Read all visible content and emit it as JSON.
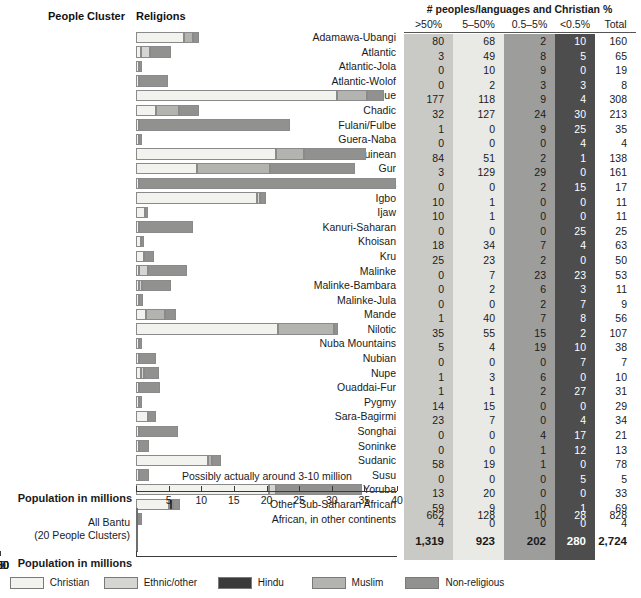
{
  "chart_headers": {
    "people_cluster": "People Cluster",
    "religions": "Religions"
  },
  "axis": {
    "title": "Population in millions",
    "top_ticks": [
      "5",
      "10",
      "15",
      "20",
      "25",
      "30",
      "35",
      "40"
    ],
    "bantu_ticks": [
      "50",
      "100",
      "150",
      "200",
      "250",
      "300"
    ],
    "top_max": 40,
    "bantu_max": 300
  },
  "annotation": "Possibly actually around 3-10 million",
  "bantu": {
    "label_line1": "All Bantu",
    "label_line2": "(20 People Clusters)"
  },
  "legend": [
    {
      "name": "Christian",
      "color": "#f2f2ef"
    },
    {
      "name": "Ethnic/other",
      "color": "#d5d5d2"
    },
    {
      "name": "Hindu",
      "color": "#3a3a3a"
    },
    {
      "name": "Muslim",
      "color": "#b3b3b0"
    },
    {
      "name": "Non-religious",
      "color": "#919190"
    }
  ],
  "table": {
    "title": "# peoples/languages and Christian %",
    "columns": [
      ">50%",
      "5–50%",
      "0.5–5%",
      "<0.5%",
      "Total"
    ],
    "summary_row": [
      "662",
      "128",
      "10",
      "28",
      "828"
    ],
    "grand_total_row": [
      "1,319",
      "923",
      "202",
      "280",
      "2,724"
    ]
  },
  "chart_data": {
    "type": "bar",
    "title": "Religions",
    "xlabel": "Population in millions",
    "ylabel": "People Cluster",
    "stacked": true,
    "xlim": [
      0,
      40
    ],
    "grid": false,
    "legend_position": "bottom",
    "series_names": [
      "Christian",
      "Ethnic/other",
      "Hindu",
      "Muslim",
      "Non-religious"
    ],
    "series_colors": [
      "#f2f2ef",
      "#d5d5d2",
      "#3a3a3a",
      "#b3b3b0",
      "#919190"
    ],
    "categories": [
      "Adamawa-Ubangi",
      "Atlantic",
      "Atlantic-Jola",
      "Atlantic-Wolof",
      "Benue",
      "Chadic",
      "Fulani/Fulbe",
      "Guera-Naba",
      "Guinean",
      "Gur",
      "Hausa",
      "Igbo",
      "Ijaw",
      "Kanuri-Saharan",
      "Khoisan",
      "Kru",
      "Malinke",
      "Malinke-Bambara",
      "Malinke-Jula",
      "Mande",
      "Nilotic",
      "Nuba Mountains",
      "Nubian",
      "Nupe",
      "Ouaddai-Fur",
      "Pygmy",
      "Sara-Bagirmi",
      "Songhai",
      "Soninke",
      "Sudanic",
      "Susu",
      "Yoruba",
      "Other Sub-Saharan African",
      "African, in other continents"
    ],
    "stacks": [
      {
        "category": "Adamawa-Ubangi",
        "christian": 7.3,
        "ethnic": 0.0,
        "hindu": 0.0,
        "muslim": 1.4,
        "nonreligious": 1.0
      },
      {
        "category": "Atlantic",
        "christian": 0.8,
        "ethnic": 1.3,
        "hindu": 0.0,
        "muslim": 0.0,
        "nonreligious": 3.2
      },
      {
        "category": "Atlantic-Jola",
        "christian": 0.15,
        "ethnic": 0.0,
        "hindu": 0.0,
        "muslim": 0.0,
        "nonreligious": 0.25
      },
      {
        "category": "Atlantic-Wolof",
        "christian": 0.1,
        "ethnic": 0.0,
        "hindu": 0.0,
        "muslim": 0.0,
        "nonreligious": 4.5
      },
      {
        "category": "Benue",
        "christian": 30.8,
        "ethnic": 0.0,
        "hindu": 0.0,
        "muslim": 4.6,
        "nonreligious": 2.6
      },
      {
        "category": "Chadic",
        "christian": 3.0,
        "ethnic": 0.0,
        "hindu": 0.0,
        "muslim": 3.6,
        "nonreligious": 3.1
      },
      {
        "category": "Fulani/Fulbe",
        "christian": 0.2,
        "ethnic": 0.0,
        "hindu": 0.0,
        "muslim": 0.0,
        "nonreligious": 23.2
      },
      {
        "category": "Guera-Naba",
        "christian": 0.1,
        "ethnic": 0.0,
        "hindu": 0.0,
        "muslim": 0.0,
        "nonreligious": 0.3
      },
      {
        "category": "Guinean",
        "christian": 21.5,
        "ethnic": 0.0,
        "hindu": 0.0,
        "muslim": 4.2,
        "nonreligious": 9.6
      },
      {
        "category": "Gur",
        "christian": 9.3,
        "ethnic": 0.0,
        "hindu": 0.0,
        "muslim": 11.3,
        "nonreligious": 13.0
      },
      {
        "category": "Hausa",
        "christian": 0.5,
        "ethnic": 0.0,
        "hindu": 0.0,
        "muslim": 0.0,
        "nonreligious": 39.3
      },
      {
        "category": "Igbo",
        "christian": 18.5,
        "ethnic": 0.3,
        "hindu": 0.0,
        "muslim": 0.0,
        "nonreligious": 0.9
      },
      {
        "category": "Ijaw",
        "christian": 1.4,
        "ethnic": 0.0,
        "hindu": 0.0,
        "muslim": 0.0,
        "nonreligious": 0.5
      },
      {
        "category": "Kanuri-Saharan",
        "christian": 0.1,
        "ethnic": 0.0,
        "hindu": 0.0,
        "muslim": 0.0,
        "nonreligious": 8.2
      },
      {
        "category": "Khoisan",
        "christian": 0.7,
        "ethnic": 0.0,
        "hindu": 0.0,
        "muslim": 0.0,
        "nonreligious": 0.35
      },
      {
        "category": "Kru",
        "christian": 1.3,
        "ethnic": 0.0,
        "hindu": 0.0,
        "muslim": 0.0,
        "nonreligious": 1.4
      },
      {
        "category": "Malinke",
        "christian": 0.4,
        "ethnic": 1.4,
        "hindu": 0.0,
        "muslim": 0.0,
        "nonreligious": 6.0
      },
      {
        "category": "Malinke-Bambara",
        "christian": 0.25,
        "ethnic": 0.3,
        "hindu": 0.0,
        "muslim": 0.0,
        "nonreligious": 4.5
      },
      {
        "category": "Malinke-Jula",
        "christian": 0.1,
        "ethnic": 0.0,
        "hindu": 0.0,
        "muslim": 0.0,
        "nonreligious": 0.6
      },
      {
        "category": "Mande",
        "christian": 1.6,
        "ethnic": 0.0,
        "hindu": 0.0,
        "muslim": 2.9,
        "nonreligious": 1.6
      },
      {
        "category": "Nilotic",
        "christian": 21.8,
        "ethnic": 0.0,
        "hindu": 0.0,
        "muslim": 8.6,
        "nonreligious": 0.6
      },
      {
        "category": "Nuba Mountains",
        "christian": 0.2,
        "ethnic": 0.0,
        "hindu": 0.0,
        "muslim": 0.0,
        "nonreligious": 0.5
      },
      {
        "category": "Nubian",
        "christian": 0.1,
        "ethnic": 0.0,
        "hindu": 0.0,
        "muslim": 0.0,
        "nonreligious": 2.6
      },
      {
        "category": "Nupe",
        "christian": 0.7,
        "ethnic": 0.25,
        "hindu": 0.0,
        "muslim": 0.0,
        "nonreligious": 2.3
      },
      {
        "category": "Ouaddai-Fur",
        "christian": 0.1,
        "ethnic": 0.0,
        "hindu": 0.0,
        "muslim": 0.0,
        "nonreligious": 3.2
      },
      {
        "category": "Pygmy",
        "christian": 0.2,
        "ethnic": 0.0,
        "hindu": 0.0,
        "muslim": 0.0,
        "nonreligious": 0.15
      },
      {
        "category": "Sara-Bagirmi",
        "christian": 1.9,
        "ethnic": 0.0,
        "hindu": 0.0,
        "muslim": 0.0,
        "nonreligious": 1.1
      },
      {
        "category": "Songhai",
        "christian": 0.15,
        "ethnic": 0.0,
        "hindu": 0.0,
        "muslim": 0.0,
        "nonreligious": 6.0
      },
      {
        "category": "Soninke",
        "christian": 0.1,
        "ethnic": 0.0,
        "hindu": 0.0,
        "muslim": 0.0,
        "nonreligious": 1.6
      },
      {
        "category": "Sudanic",
        "christian": 11.0,
        "ethnic": 0.0,
        "hindu": 0.0,
        "muslim": 0.6,
        "nonreligious": 1.4
      },
      {
        "category": "Susu",
        "christian": 0.1,
        "ethnic": 0.0,
        "hindu": 0.0,
        "muslim": 0.0,
        "nonreligious": 1.5
      },
      {
        "category": "Yoruba",
        "christian": 20.4,
        "ethnic": 1.1,
        "hindu": 0.0,
        "muslim": 0.0,
        "nonreligious": 13.2
      },
      {
        "category": "Other Sub-Saharan African",
        "christian": 5.1,
        "ethnic": 0.0,
        "hindu": 0.5,
        "muslim": 0.0,
        "nonreligious": 1.2
      },
      {
        "category": "African, in other continents",
        "christian": 0.15,
        "ethnic": 0.0,
        "hindu": 0.0,
        "muslim": 0.0,
        "nonreligious": 0.1
      }
    ],
    "bantu_stack": {
      "category": "All Bantu",
      "christian": 228,
      "ethnic": 0,
      "hindu": 0,
      "muslim": 37,
      "nonreligious": 25
    },
    "table_rows": [
      {
        "cluster": "Adamawa-Ubangi",
        "gt50": "80",
        "p5_50": "68",
        "p05_5": "2",
        "lt05": "10",
        "total": "160"
      },
      {
        "cluster": "Atlantic",
        "gt50": "3",
        "p5_50": "49",
        "p05_5": "8",
        "lt05": "5",
        "total": "65"
      },
      {
        "cluster": "Atlantic-Jola",
        "gt50": "0",
        "p5_50": "10",
        "p05_5": "9",
        "lt05": "0",
        "total": "19"
      },
      {
        "cluster": "Atlantic-Wolof",
        "gt50": "0",
        "p5_50": "2",
        "p05_5": "3",
        "lt05": "3",
        "total": "8"
      },
      {
        "cluster": "Benue",
        "gt50": "177",
        "p5_50": "118",
        "p05_5": "9",
        "lt05": "4",
        "total": "308"
      },
      {
        "cluster": "Chadic",
        "gt50": "32",
        "p5_50": "127",
        "p05_5": "24",
        "lt05": "30",
        "total": "213"
      },
      {
        "cluster": "Fulani/Fulbe",
        "gt50": "1",
        "p5_50": "0",
        "p05_5": "9",
        "lt05": "25",
        "total": "35"
      },
      {
        "cluster": "Guera-Naba",
        "gt50": "0",
        "p5_50": "0",
        "p05_5": "0",
        "lt05": "4",
        "total": "4"
      },
      {
        "cluster": "Guinean",
        "gt50": "84",
        "p5_50": "51",
        "p05_5": "2",
        "lt05": "1",
        "total": "138"
      },
      {
        "cluster": "Gur",
        "gt50": "3",
        "p5_50": "129",
        "p05_5": "29",
        "lt05": "0",
        "total": "161"
      },
      {
        "cluster": "Hausa",
        "gt50": "0",
        "p5_50": "0",
        "p05_5": "2",
        "lt05": "15",
        "total": "17"
      },
      {
        "cluster": "Igbo",
        "gt50": "10",
        "p5_50": "1",
        "p05_5": "0",
        "lt05": "0",
        "total": "11"
      },
      {
        "cluster": "Ijaw",
        "gt50": "10",
        "p5_50": "1",
        "p05_5": "0",
        "lt05": "0",
        "total": "11"
      },
      {
        "cluster": "Kanuri-Saharan",
        "gt50": "0",
        "p5_50": "0",
        "p05_5": "0",
        "lt05": "25",
        "total": "25"
      },
      {
        "cluster": "Khoisan",
        "gt50": "18",
        "p5_50": "34",
        "p05_5": "7",
        "lt05": "4",
        "total": "63"
      },
      {
        "cluster": "Kru",
        "gt50": "25",
        "p5_50": "23",
        "p05_5": "2",
        "lt05": "0",
        "total": "50"
      },
      {
        "cluster": "Malinke",
        "gt50": "0",
        "p5_50": "7",
        "p05_5": "23",
        "lt05": "23",
        "total": "53"
      },
      {
        "cluster": "Malinke-Bambara",
        "gt50": "0",
        "p5_50": "2",
        "p05_5": "6",
        "lt05": "3",
        "total": "11"
      },
      {
        "cluster": "Malinke-Jula",
        "gt50": "0",
        "p5_50": "0",
        "p05_5": "2",
        "lt05": "7",
        "total": "9"
      },
      {
        "cluster": "Mande",
        "gt50": "1",
        "p5_50": "40",
        "p05_5": "7",
        "lt05": "8",
        "total": "56"
      },
      {
        "cluster": "Nilotic",
        "gt50": "35",
        "p5_50": "55",
        "p05_5": "15",
        "lt05": "2",
        "total": "107"
      },
      {
        "cluster": "Nuba Mountains",
        "gt50": "5",
        "p5_50": "4",
        "p05_5": "19",
        "lt05": "10",
        "total": "38"
      },
      {
        "cluster": "Nubian",
        "gt50": "0",
        "p5_50": "0",
        "p05_5": "0",
        "lt05": "7",
        "total": "7"
      },
      {
        "cluster": "Nupe",
        "gt50": "1",
        "p5_50": "3",
        "p05_5": "6",
        "lt05": "0",
        "total": "10"
      },
      {
        "cluster": "Ouaddai-Fur",
        "gt50": "1",
        "p5_50": "1",
        "p05_5": "2",
        "lt05": "27",
        "total": "31"
      },
      {
        "cluster": "Pygmy",
        "gt50": "14",
        "p5_50": "15",
        "p05_5": "0",
        "lt05": "0",
        "total": "29"
      },
      {
        "cluster": "Sara-Bagirmi",
        "gt50": "23",
        "p5_50": "7",
        "p05_5": "0",
        "lt05": "4",
        "total": "34"
      },
      {
        "cluster": "Songhai",
        "gt50": "0",
        "p5_50": "0",
        "p05_5": "4",
        "lt05": "17",
        "total": "21"
      },
      {
        "cluster": "Soninke",
        "gt50": "0",
        "p5_50": "0",
        "p05_5": "1",
        "lt05": "12",
        "total": "13"
      },
      {
        "cluster": "Sudanic",
        "gt50": "58",
        "p5_50": "19",
        "p05_5": "1",
        "lt05": "0",
        "total": "78"
      },
      {
        "cluster": "Susu",
        "gt50": "0",
        "p5_50": "0",
        "p05_5": "0",
        "lt05": "5",
        "total": "5"
      },
      {
        "cluster": "Yoruba",
        "gt50": "13",
        "p5_50": "20",
        "p05_5": "0",
        "lt05": "0",
        "total": "33"
      },
      {
        "cluster": "Other Sub-Saharan African",
        "gt50": "59",
        "p5_50": "9",
        "p05_5": "0",
        "lt05": "1",
        "total": "69"
      },
      {
        "cluster": "African, in other continents",
        "gt50": "4",
        "p5_50": "0",
        "p05_5": "0",
        "lt05": "0",
        "total": "4"
      }
    ]
  }
}
